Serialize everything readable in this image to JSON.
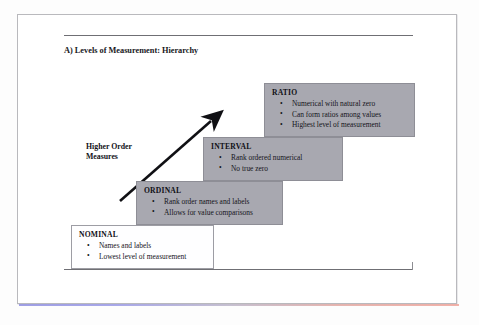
{
  "document": {
    "section_title": "A) Levels of Measurement: Hierarchy"
  },
  "arrow": {
    "label_line1": "Higher Order",
    "label_line2": "Measures",
    "direction": "up-right",
    "icon": "arrow-up-right-icon"
  },
  "colors": {
    "shaded_box_fill": "#a8a8b0",
    "shaded_box_border": "#8e8e96",
    "plain_box_fill": "#fefeff",
    "plain_box_border": "#9d9da4",
    "rule": "#6f6f74",
    "text": "#15151b"
  },
  "levels": [
    {
      "id": "ratio",
      "title": "RATIO",
      "style": "shaded",
      "bullets": [
        "Numerical with natural zero",
        "Can form ratios among values",
        "Highest level of measurement"
      ]
    },
    {
      "id": "interval",
      "title": "INTERVAL",
      "style": "shaded",
      "bullets": [
        "Rank ordered numerical",
        "No true zero"
      ]
    },
    {
      "id": "ordinal",
      "title": "ORDINAL",
      "style": "shaded",
      "bullets": [
        "Rank order names and labels",
        "Allows for value comparisons"
      ]
    },
    {
      "id": "nominal",
      "title": "NOMINAL",
      "style": "plain",
      "bullets": [
        "Names and labels",
        "Lowest level of measurement"
      ]
    }
  ]
}
